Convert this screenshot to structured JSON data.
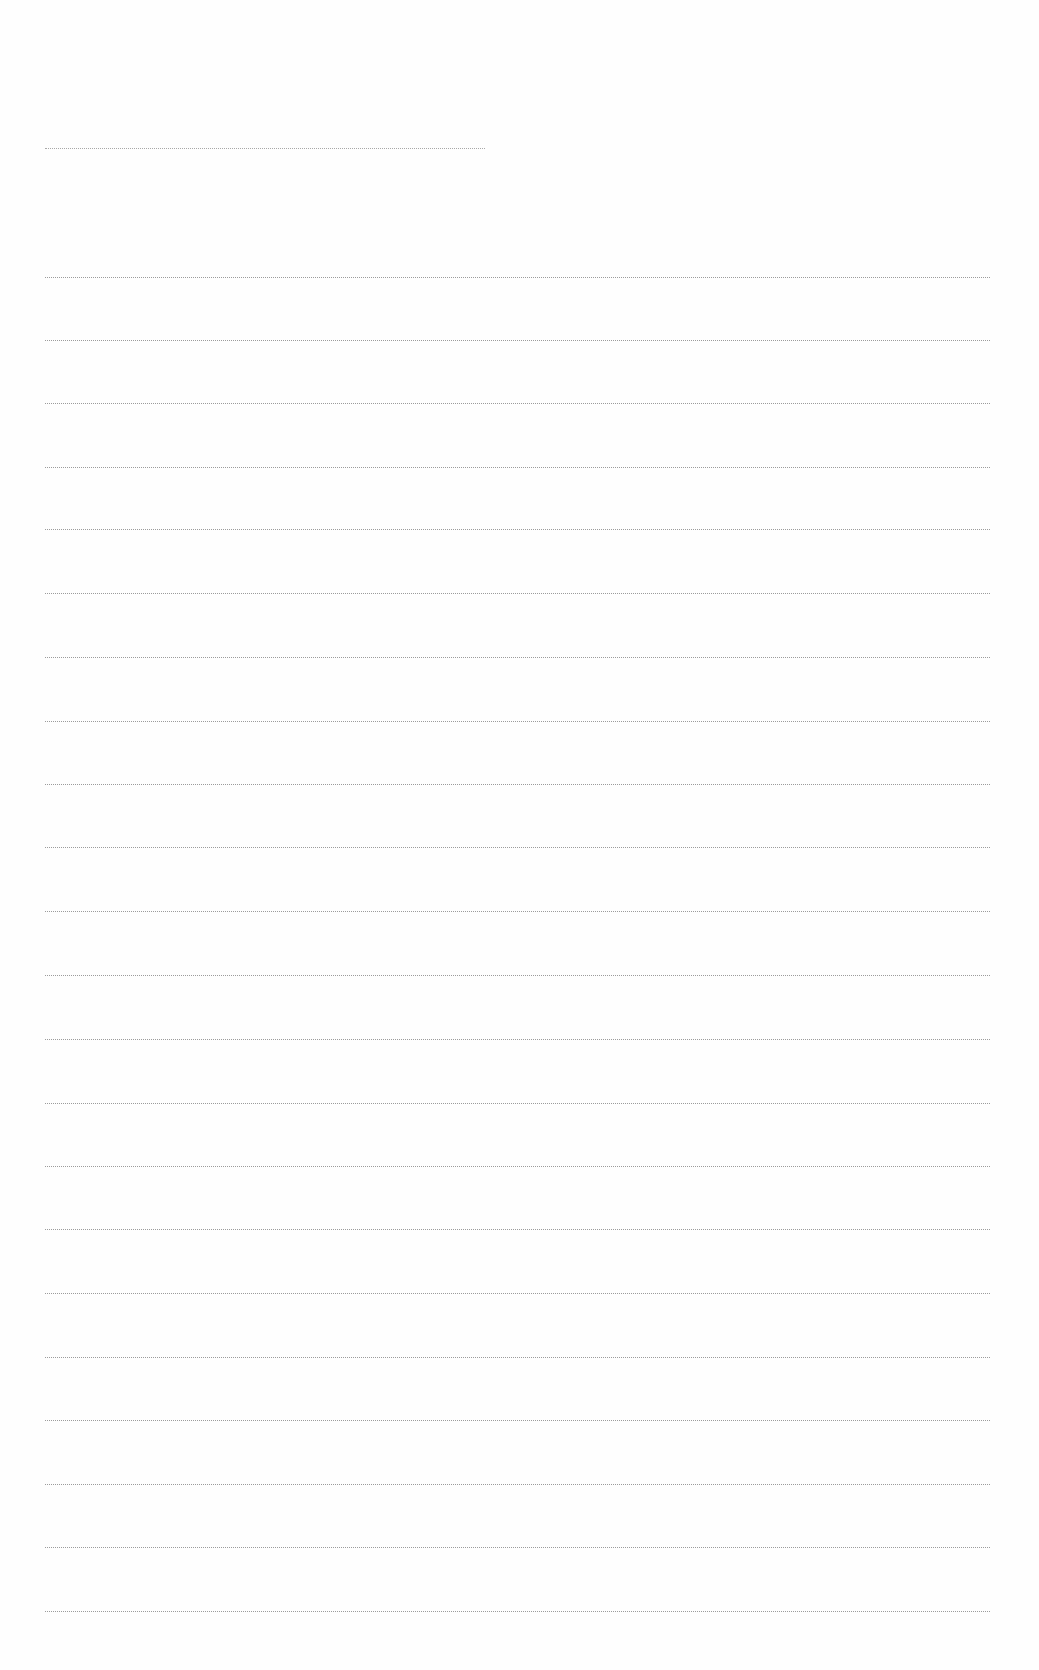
{
  "page": {
    "type": "blank lined sheet",
    "background": "#fefefe",
    "rule_color": "#8a8a8a"
  },
  "header_rule": {
    "x1": 45,
    "x2": 485,
    "y": 148
  },
  "ruled_lines": {
    "x1": 45,
    "x2": 990,
    "ys": [
      277,
      340,
      403,
      467,
      529,
      593,
      657,
      721,
      784,
      847,
      911,
      975,
      1039,
      1103,
      1166,
      1229,
      1293,
      1357,
      1420,
      1484,
      1547,
      1611
    ]
  }
}
